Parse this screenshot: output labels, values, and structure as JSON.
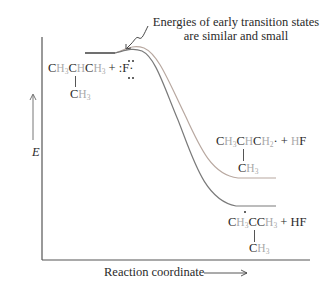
{
  "annotation": {
    "line1": "Energies of early transition states",
    "line2": "are similar and small"
  },
  "axes": {
    "y_label": "E",
    "x_label": "Reaction coordinate",
    "x_arrow": "⟶"
  },
  "reactants": {
    "main_chain": [
      "C",
      "H",
      "3",
      "C",
      "H",
      "C",
      "H",
      "3"
    ],
    "plus": "+",
    "reagent": ":F·",
    "branch": "CH3",
    "branch_c": "C",
    "branch_h": "H",
    "branch_sub": "3"
  },
  "product_primary": {
    "c1": "C",
    "h1": "H",
    "s1": "3",
    "c2": "C",
    "h2": "H",
    "c3": "C",
    "h3": "H",
    "s3": "2",
    "radical": "·",
    "plus": "+",
    "hf_h": "H",
    "hf_f": "F",
    "branch_c": "C",
    "branch_h": "H",
    "branch_sub": "3"
  },
  "product_tertiary": {
    "c1": "C",
    "h1": "H",
    "s1": "3",
    "c2": "C",
    "c3": "C",
    "h3": "H",
    "s3": "3",
    "plus": "+",
    "hf": "HF",
    "branch_c": "C",
    "branch_h": "H",
    "branch_sub": "3"
  },
  "colors": {
    "axis": "#555555",
    "curve_primary": "#b8a8a0",
    "curve_tertiary": "#7a7a7a",
    "hydrogen_text": "#a9a9a9"
  }
}
